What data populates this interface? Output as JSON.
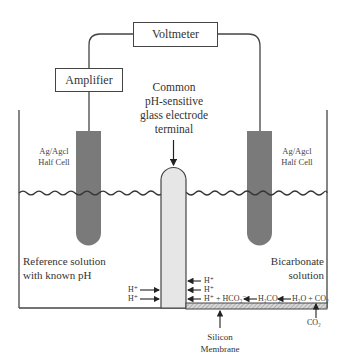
{
  "boxes": {
    "voltmeter": "Voltmeter",
    "amplifier": "Amplifier"
  },
  "labels": {
    "common_electrode": [
      "Common",
      "pH-sensitive",
      "glass electrode",
      "terminal"
    ],
    "left_half_cell": [
      "Ag/Agcl",
      "Half Cell"
    ],
    "right_half_cell": [
      "Ag/Agcl",
      "Half Cell"
    ],
    "reference_solution": [
      "Reference solution",
      "with known pH"
    ],
    "bicarbonate_solution": [
      "Bicarbonate",
      "solution"
    ],
    "membrane": [
      "Silicon",
      "Membrane"
    ],
    "co2_below": "CO₂"
  },
  "ions": {
    "left_h1": "H⁺",
    "left_h2": "H⁺",
    "right_h1": "H⁺",
    "right_h2": "H⁺",
    "reaction": {
      "products": "H⁺ + HCO₃⁻",
      "intermediate": "H₂CO₃",
      "reactants": "H₂O + CO₂"
    }
  },
  "colors": {
    "electrode_gray": "#7a7a7a",
    "glass_electrode_fill": "#e6e6e6",
    "line": "#444444",
    "membrane_hatch": "#999999"
  }
}
